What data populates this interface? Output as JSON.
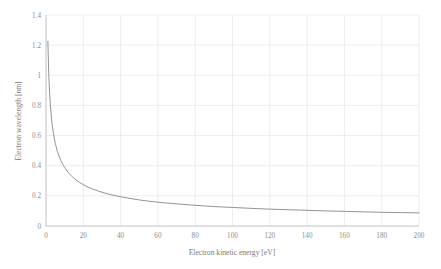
{
  "chart_data": {
    "type": "line",
    "title": "",
    "subtitle": "",
    "xlabel": "Electron kinetic energy [eV]",
    "ylabel": "Electron wavelength [nm]",
    "xlim": [
      0,
      200
    ],
    "ylim": [
      0,
      1.4
    ],
    "grid": true,
    "legend": false,
    "legend_position": "none",
    "x_ticks": [
      0,
      20,
      40,
      60,
      80,
      100,
      120,
      140,
      160,
      180,
      200
    ],
    "x_tick_labels": [
      "0",
      "20",
      "40",
      "60",
      "80",
      "100",
      "120",
      "140",
      "160",
      "180",
      "200"
    ],
    "y_ticks": [
      0,
      0.2,
      0.4,
      0.6,
      0.8,
      1,
      1.2,
      1.4
    ],
    "y_tick_labels": [
      "0",
      "0.2",
      "0.4",
      "0.6",
      "0.8",
      "1",
      "1.2",
      "1.4"
    ],
    "series": [
      {
        "name": "Electron wavelength",
        "color": "#808080",
        "relation": "lambda = 1.226 / sqrt(E)",
        "x": [
          1,
          1.5,
          2,
          2.5,
          3,
          3.5,
          4,
          4.5,
          5,
          6,
          7,
          8,
          9,
          10,
          11,
          12,
          13,
          14,
          15,
          16,
          18,
          20,
          22,
          25,
          28,
          30,
          35,
          40,
          45,
          50,
          55,
          60,
          65,
          70,
          75,
          80,
          85,
          90,
          95,
          100,
          110,
          120,
          130,
          140,
          150,
          160,
          170,
          180,
          190,
          200
        ],
        "y": [
          1.226,
          1.001,
          0.867,
          0.775,
          0.708,
          0.655,
          0.613,
          0.578,
          0.548,
          0.5,
          0.463,
          0.433,
          0.409,
          0.388,
          0.37,
          0.354,
          0.34,
          0.328,
          0.317,
          0.307,
          0.289,
          0.274,
          0.261,
          0.245,
          0.232,
          0.224,
          0.207,
          0.194,
          0.183,
          0.173,
          0.165,
          0.158,
          0.152,
          0.147,
          0.142,
          0.137,
          0.133,
          0.129,
          0.126,
          0.123,
          0.117,
          0.112,
          0.108,
          0.104,
          0.1,
          0.097,
          0.094,
          0.091,
          0.089,
          0.087
        ]
      }
    ]
  },
  "colors": {
    "curve": "#808080",
    "grid": "#e8e8ea",
    "axis": "#b9b9bd",
    "tick_text": "#8c8c8c",
    "axis_title": "#7a7a7a",
    "background": "#ffffff"
  }
}
